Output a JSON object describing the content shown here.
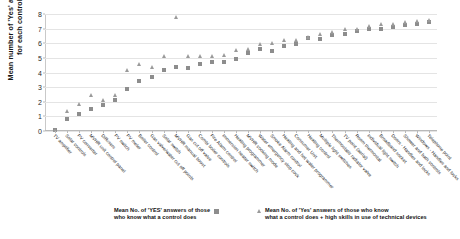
{
  "chart_data": {
    "type": "scatter",
    "title": "",
    "xlabel": "",
    "ylabel": "Mean number of 'Yes' answers for each control",
    "ylabel_line1": "Mean number of 'Yes' answers",
    "ylabel_line2": "for each control",
    "ylim": [
      0,
      8
    ],
    "yticks": [
      0,
      1,
      2,
      3,
      4,
      5,
      6,
      7,
      8
    ],
    "grid": true,
    "legend_position": "bottom",
    "categories": [
      "TV amplifier",
      "Solar controls",
      "PV converter",
      "MVHR unit control panel",
      "Diffusers",
      "PV switch",
      "PV meter",
      "Boiler control",
      "Gas valve/water cut off points",
      "Solar switch",
      "MVHR manual boost",
      "Gas cut off valve",
      "Combi boiler controls",
      "Fire Alarm control",
      "Immersion heater switch",
      "Heating programmer",
      "MVHR cooking mode",
      "Water emergency stop cock",
      "Smoke Alarm control",
      "Heating and hot water programmer",
      "Consumer Unit",
      "Heating control",
      "Multiple light switches",
      "Thermostatic radiator valve",
      "TV point (aerial)",
      "Room thermostat",
      "Individual light switch",
      "Broadband socket",
      "Doors - Handles and locks",
      "Shower and bath controls",
      "Windows - Handles and locks",
      "Telephone point"
    ],
    "series": [
      {
        "name": "Mean No. of 'YES' answers of those who know what a control does",
        "marker": "square",
        "color": "#8d8d8d",
        "values": [
          0.05,
          0.85,
          1.15,
          1.5,
          1.8,
          2.1,
          2.85,
          3.4,
          3.7,
          4.15,
          4.35,
          4.3,
          4.6,
          4.7,
          4.75,
          4.95,
          5.35,
          5.6,
          5.5,
          5.8,
          5.95,
          6.35,
          6.3,
          6.55,
          6.6,
          6.85,
          6.95,
          7.0,
          7.1,
          7.25,
          7.3,
          7.45
        ]
      },
      {
        "name": "Mean No. of 'Yes' answers of those who know what a control does + high skills in use of technical devices",
        "marker": "triangle",
        "color": "#9a9a9a",
        "values": [
          0.05,
          1.35,
          1.85,
          2.45,
          2.1,
          2.45,
          4.2,
          4.6,
          4.35,
          5.1,
          7.8,
          5.15,
          5.1,
          5.15,
          5.2,
          5.55,
          5.6,
          5.95,
          6.0,
          6.2,
          6.25,
          6.4,
          6.6,
          6.75,
          6.95,
          7.0,
          7.2,
          7.35,
          7.3,
          7.45,
          7.5,
          7.6
        ]
      }
    ]
  },
  "legend": [
    {
      "marker": "square",
      "line1": "Mean No. of 'YES' answers of those",
      "line2": "who know what a control does"
    },
    {
      "marker": "triangle",
      "line1": "Mean No. of 'Yes' answers of those who know",
      "line2": "what a control does + high skills in use of technical devices"
    }
  ]
}
